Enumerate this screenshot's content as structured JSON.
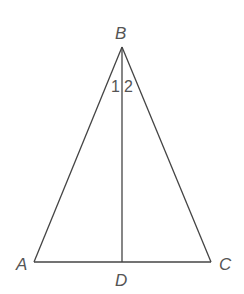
{
  "figure": {
    "type": "isosceles-triangle-with-altitude",
    "vertices": {
      "A": {
        "label": "A",
        "x": 34,
        "y": 262
      },
      "B": {
        "label": "B",
        "x": 122,
        "y": 47
      },
      "C": {
        "label": "C",
        "x": 211,
        "y": 262
      },
      "D": {
        "label": "D",
        "x": 122,
        "y": 262
      }
    },
    "segments": [
      "AB",
      "BC",
      "AC",
      "BD"
    ],
    "angle_labels": [
      "1",
      "2"
    ],
    "line_color": "#444444"
  }
}
